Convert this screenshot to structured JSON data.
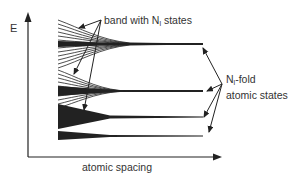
{
  "diagram": {
    "y_axis_label": "E",
    "x_axis_label": "atomic spacing",
    "band_label": {
      "prefix": "band with N",
      "subscript": "l",
      "suffix": " states"
    },
    "fold_label": {
      "prefix": "N",
      "subscript": "l",
      "suffix": "-fold",
      "line2": "atomic states"
    },
    "colors": {
      "ink": "#222222",
      "text": "#333333",
      "background": "#ffffff"
    },
    "levels": [
      {
        "name": "level-1",
        "y": 44,
        "spread_top": 18,
        "spread_bottom": 24
      },
      {
        "name": "level-2",
        "y": 91,
        "spread_top": 12,
        "spread_bottom": 12
      },
      {
        "name": "level-3",
        "y": 117,
        "spread_top": 6,
        "spread_bottom": 6
      },
      {
        "name": "level-4",
        "y": 136,
        "spread_top": 3,
        "spread_bottom": 3
      }
    ]
  }
}
